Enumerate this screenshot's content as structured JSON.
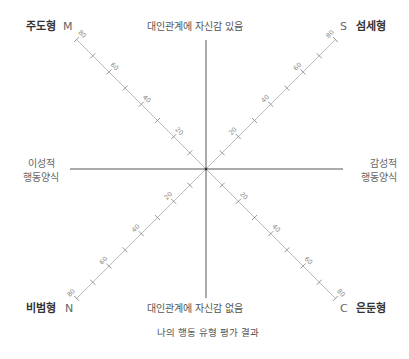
{
  "diagram": {
    "title": "나의 행동 유형 평가 결과",
    "axes": {
      "top": "대인관계에 자신감 있음",
      "bottom": "대인관계에 자신감 없음",
      "left_line1": "이성적",
      "left_line2": "행동양식",
      "right_line1": "감성적",
      "right_line2": "행동양식"
    },
    "quadrants": {
      "top_left": {
        "letter": "M",
        "name": "주도형"
      },
      "top_right": {
        "letter": "S",
        "name": "섬세형"
      },
      "bottom_left": {
        "letter": "N",
        "name": "비범형"
      },
      "bottom_right": {
        "letter": "C",
        "name": "은둔형"
      }
    },
    "scale": {
      "min": 0,
      "max": 80,
      "tick_step": 10,
      "labels": [
        "20",
        "40",
        "60",
        "80"
      ]
    },
    "colors": {
      "axis": "#555555",
      "diagonal": "#bbbbbb",
      "tick": "#777777",
      "text": "#555555",
      "type_name": "#333333"
    }
  }
}
